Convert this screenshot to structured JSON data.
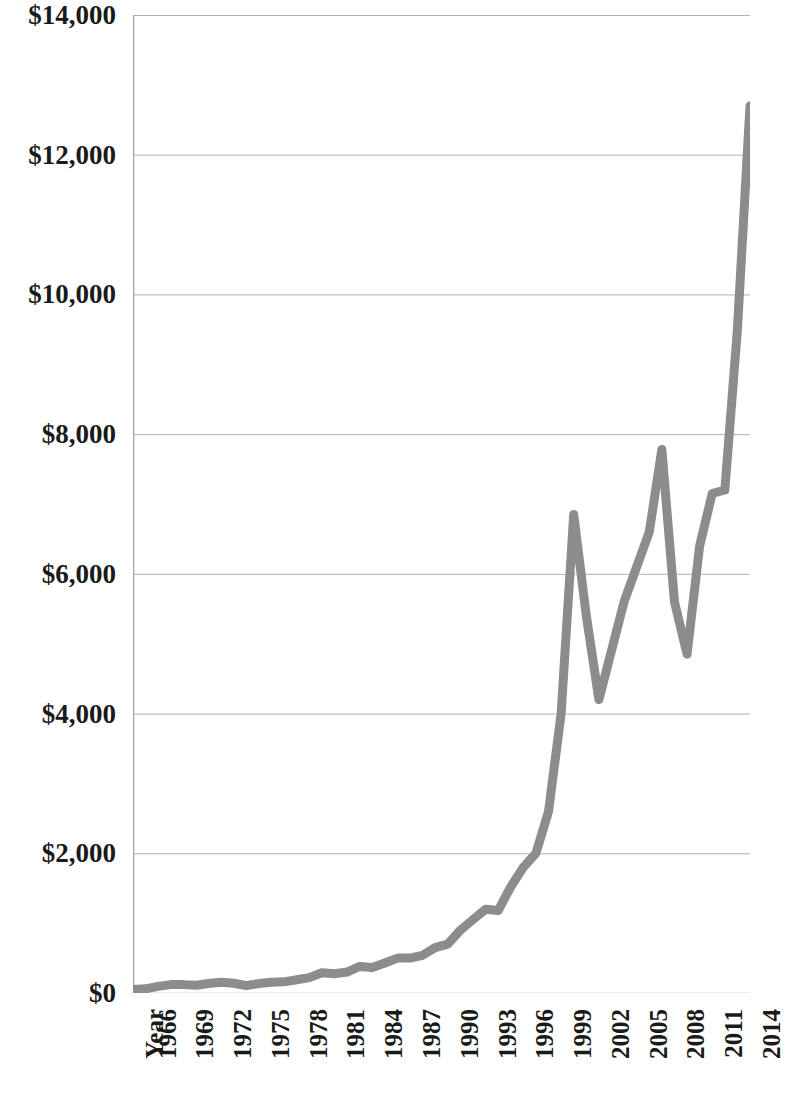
{
  "chart_data": {
    "type": "line",
    "title": "",
    "subtitle": "",
    "xlabel": "Year",
    "ylabel": "",
    "xlim": [
      1965,
      2014
    ],
    "ylim": [
      0,
      14000
    ],
    "grid": "horizontal",
    "legend": "none",
    "line_color": "#8c8c8c",
    "axis_color": "#a6a6a6",
    "gridline_color": "#b3b3b3",
    "text_color": "#1a1a1a",
    "y_ticks": [
      0,
      2000,
      4000,
      6000,
      8000,
      10000,
      12000,
      14000
    ],
    "y_tick_labels": [
      "$0",
      "$2,000",
      "$4,000",
      "$6,000",
      "$8,000",
      "$10,000",
      "$12,000",
      "$14,000"
    ],
    "x_tick_labels": [
      "Year",
      "1966",
      "1969",
      "1972",
      "1975",
      "1978",
      "1981",
      "1984",
      "1987",
      "1990",
      "1993",
      "1996",
      "1999",
      "2002",
      "2005",
      "2008",
      "2011",
      "2014"
    ],
    "x_tick_years": [
      1965,
      1966,
      1969,
      1972,
      1975,
      1978,
      1981,
      1984,
      1987,
      1990,
      1993,
      1996,
      1999,
      2002,
      2005,
      2008,
      2011,
      2014
    ],
    "x": [
      1965,
      1966,
      1967,
      1968,
      1969,
      1970,
      1971,
      1972,
      1973,
      1974,
      1975,
      1976,
      1977,
      1978,
      1979,
      1980,
      1981,
      1982,
      1983,
      1984,
      1985,
      1986,
      1987,
      1988,
      1989,
      1990,
      1991,
      1992,
      1993,
      1994,
      1995,
      1996,
      1997,
      1998,
      1999,
      2000,
      2001,
      2002,
      2003,
      2004,
      2005,
      2006,
      2007,
      2008,
      2009,
      2010,
      2011,
      2012,
      2013,
      2014
    ],
    "values": [
      50,
      60,
      95,
      120,
      120,
      110,
      135,
      155,
      140,
      105,
      135,
      155,
      160,
      190,
      220,
      290,
      275,
      300,
      380,
      365,
      430,
      500,
      500,
      540,
      650,
      700,
      900,
      1050,
      1200,
      1180,
      1520,
      1800,
      2000,
      2600,
      4000,
      6850,
      5400,
      4200,
      4900,
      5600,
      6100,
      6600,
      7780,
      5600,
      4850,
      6400,
      7150,
      7200,
      9500,
      12700
    ],
    "annotations": []
  }
}
